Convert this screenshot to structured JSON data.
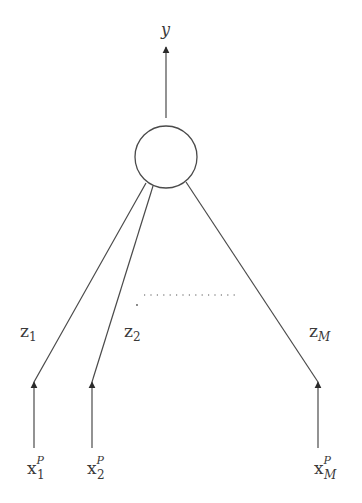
{
  "diagram": {
    "type": "network",
    "output": {
      "label": "y"
    },
    "node": {
      "shape": "circle"
    },
    "hidden": [
      {
        "base": "z",
        "sub": "1"
      },
      {
        "base": "z",
        "sub": "2"
      },
      {
        "base": "z",
        "sub": "M"
      }
    ],
    "inputs": [
      {
        "base": "x",
        "sup": "P",
        "sub": "1"
      },
      {
        "base": "x",
        "sup": "P",
        "sub": "2"
      },
      {
        "base": "x",
        "sup": "P",
        "sub": "M"
      }
    ],
    "ellipsis": "............"
  }
}
